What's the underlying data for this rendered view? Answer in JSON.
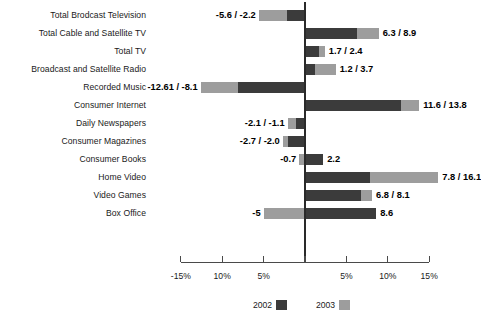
{
  "chart_data": {
    "type": "bar",
    "title": "",
    "subtitle": "",
    "xlabel": "",
    "ylabel": "",
    "orientation": "horizontal",
    "grid": false,
    "legend_position": "bottom",
    "xlim": [
      -15,
      15
    ],
    "xtick_values": [
      -15,
      -10,
      -5,
      0,
      5,
      10,
      15
    ],
    "xtick_labels": [
      "-15%",
      "10%",
      "5%",
      "",
      "5%",
      "10%",
      "15%"
    ],
    "categories": [
      "Total Brodcast Television",
      "Total Cable and Satellite TV",
      "Total TV",
      "Broadcast and Satellite Radio",
      "Recorded Music",
      "Consumer Internet",
      "Daily Newspapers",
      "Consumer Magazines",
      "Consumer Books",
      "Home Video",
      "Video Games",
      "Box Office"
    ],
    "series": [
      {
        "name": "2002",
        "color": "#3b3b3b",
        "values": [
          -2.2,
          6.3,
          1.7,
          1.2,
          -8.1,
          11.6,
          -1.1,
          -2.0,
          2.2,
          7.8,
          6.8,
          8.6
        ]
      },
      {
        "name": "2003",
        "color": "#9d9d9d",
        "values": [
          -5.6,
          8.9,
          2.4,
          3.7,
          -12.61,
          13.8,
          -2.1,
          -2.7,
          -0.7,
          16.1,
          8.1,
          -5.0
        ]
      }
    ],
    "point_labels": [
      "-5.6 / -2.2",
      "6.3 / 8.9",
      "1.7 / 2.4",
      "1.2 / 3.7",
      "-12.61 / -8.1",
      "11.6 / 13.8",
      "-2.1 / -1.1",
      "-2.7 / -2.0",
      "-0.7",
      "7.8 / 16.1",
      "6.8 / 8.1",
      "-5"
    ],
    "point_labels_right": [
      "",
      "",
      "",
      "",
      "",
      "",
      "",
      "",
      "2.2",
      "",
      "",
      "8.6"
    ],
    "legend": [
      {
        "label": "2002",
        "color": "#3b3b3b"
      },
      {
        "label": "2003",
        "color": "#9d9d9d"
      }
    ]
  }
}
